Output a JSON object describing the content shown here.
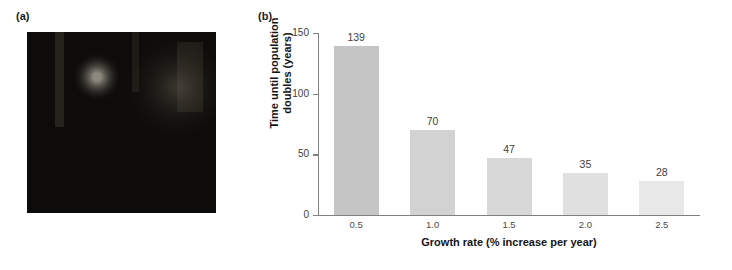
{
  "figure": {
    "panels": [
      {
        "label": "(a)",
        "type": "photograph",
        "description": "noodle-maker-photo"
      },
      {
        "label": "(b)",
        "type": "bar-chart"
      }
    ]
  },
  "panel_a": {
    "label": "(a)",
    "image_name": "hand-pulled-noodle-chef-photo"
  },
  "panel_b": {
    "label": "(b)"
  },
  "chart_data": {
    "type": "bar",
    "title": "",
    "categories": [
      "0.5",
      "1.0",
      "1.5",
      "2.0",
      "2.5"
    ],
    "values": [
      139,
      70,
      47,
      35,
      28
    ],
    "bar_colors": [
      "#c5c5c5",
      "#d2d2d2",
      "#d8d8d8",
      "#e0e0e0",
      "#e8e8e8"
    ],
    "xlabel": "Growth rate (% increase per year)",
    "ylabel": "Time until population doubles (years)",
    "ylabel_line1": "Time until population",
    "ylabel_line2": "doubles (years)",
    "ylim": [
      0,
      150
    ],
    "yticks": [
      0,
      50,
      100,
      150
    ],
    "ytick_labels": [
      "0",
      "50",
      "100",
      "150"
    ],
    "grid": false,
    "legend": false,
    "axis_color": "#808080",
    "value_label_color": "#3d3d3d"
  }
}
